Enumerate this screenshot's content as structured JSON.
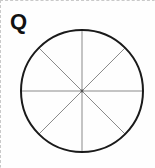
{
  "panel": {
    "background_color": "#fefefe",
    "border_color": "#c9c9c9",
    "border_style": "dashed"
  },
  "label": {
    "text": "Q",
    "color": "#111111"
  },
  "figure": {
    "name": "circle-divided-into-eight-sectors",
    "shape": "circle",
    "center_x": 81,
    "center_y": 90,
    "radius": 61,
    "outline_color": "#1a1a1a",
    "outline_width": 2,
    "fill_color": "#ffffff",
    "spoke_color": "#8a8a8a",
    "spoke_width": 1,
    "sector_count": 8,
    "diameter_count": 4,
    "diameter_angles_deg": [
      0,
      45,
      90,
      135
    ],
    "center_dot_color": "#555555"
  }
}
